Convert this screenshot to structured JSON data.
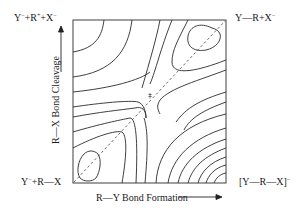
{
  "diagram": {
    "title": "",
    "type": "More O'Ferrall-Jencks energy contour diagram",
    "corners": {
      "top_left": "Y⁻ + R⁺ + X⁻",
      "top_right": "Y—R + X⁻",
      "bottom_left": "Y⁻ + R—X",
      "bottom_right": "[Y—R—X]⁻"
    },
    "x_axis": {
      "label": "R—Y Bond Formation",
      "arrow": "right-arrow"
    },
    "y_axis": {
      "label": "R—X Bond Cleavage",
      "arrow": "up-arrow"
    },
    "reaction_path": {
      "style": "dashed diagonal",
      "from": "bottom-left",
      "to": "top-right"
    },
    "transition_state_marker": "‡",
    "colors": {
      "line": "#2a2a2a",
      "background": "#ffffff"
    }
  }
}
